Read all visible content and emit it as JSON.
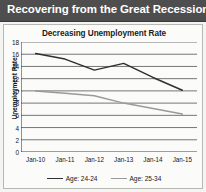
{
  "header": {
    "title": "Recovering from the Great Recession",
    "background_color": "#4e4e4e",
    "text_color": "#ffffff"
  },
  "chart_data": {
    "type": "line",
    "title": "Decreasing Unemployment Rate",
    "xlabel": "",
    "ylabel": "Unemployment Rate",
    "categories": [
      "Jan-10",
      "Jan-11",
      "Jan-12",
      "Jan-13",
      "Jan-14",
      "Jan-15"
    ],
    "ylim": [
      0,
      18
    ],
    "ytick_step": 2,
    "yticks": [
      0,
      2,
      4,
      6,
      8,
      10,
      12,
      14,
      16,
      18
    ],
    "grid": true,
    "grid_axis": "y",
    "legend_position": "bottom",
    "series": [
      {
        "name": "Age: 24-24",
        "color": "#303030",
        "values": [
          16.1,
          15.2,
          13.4,
          14.5,
          12.2,
          10.1
        ]
      },
      {
        "name": "Age: 25-34",
        "color": "#9a9a9a",
        "values": [
          10.0,
          9.6,
          9.2,
          8.0,
          7.1,
          6.2
        ]
      }
    ]
  }
}
